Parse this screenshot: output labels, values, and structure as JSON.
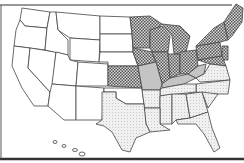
{
  "map": {
    "title": "United States regional map",
    "caption_cutoff": "",
    "legend": {
      "categories": [
        {
          "name": "none",
          "fill": "#ffffff",
          "pattern": "solid"
        },
        {
          "name": "dotted",
          "fill": "#9a9a9a",
          "pattern": "checker"
        },
        {
          "name": "dark",
          "fill": "#c8c8c8",
          "pattern": "solid"
        },
        {
          "name": "light",
          "fill": "#ececec",
          "pattern": "stipple"
        }
      ]
    },
    "regions": {
      "white": [
        "WA",
        "OR",
        "CA",
        "NV",
        "ID",
        "MT",
        "WY",
        "UT",
        "AZ",
        "CO",
        "NM",
        "ND",
        "SD",
        "NE",
        "OK",
        "AK",
        "HI"
      ],
      "dotted": [
        "MN",
        "WI",
        "MI",
        "IA",
        "IL",
        "IN",
        "OH",
        "PA",
        "NY",
        "VT",
        "NH",
        "ME",
        "MA",
        "CT",
        "RI",
        "NJ",
        "KS",
        "DE",
        "MD"
      ],
      "dark": [
        "MO",
        "KY",
        "WV"
      ],
      "light": [
        "TX",
        "AR",
        "LA",
        "MS",
        "AL",
        "TN",
        "GA",
        "FL",
        "SC",
        "NC",
        "VA"
      ]
    }
  }
}
